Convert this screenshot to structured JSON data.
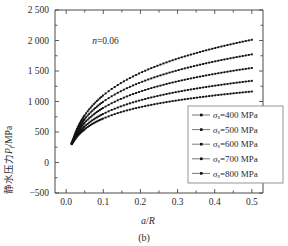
{
  "figure": {
    "caption": "(b)",
    "annotation": "n=0.06"
  },
  "chart_data": {
    "type": "line",
    "title": "",
    "subtitle": "",
    "xlabel": "a/R",
    "ylabel": "静水压力Pf/MPa",
    "xlim": [
      -0.03,
      0.53
    ],
    "ylim": [
      -500,
      2500
    ],
    "xticks": [
      0.0,
      0.1,
      0.2,
      0.3,
      0.4,
      0.5
    ],
    "xtick_labels": [
      "0.0",
      "0.1",
      "0.2",
      "0.3",
      "0.4",
      "0.5"
    ],
    "yticks": [
      -500,
      0,
      500,
      1000,
      1500,
      2000,
      2500
    ],
    "ytick_labels": [
      "−500",
      "0",
      "500",
      "1 000",
      "1 500",
      "2 000",
      "2 500"
    ],
    "grid": false,
    "legend_position": "lower-right",
    "marker": "filled-square",
    "annotations": [
      {
        "text": "n=0.06",
        "x": 0.07,
        "y": 2000
      }
    ],
    "x": [
      0.015,
      0.02,
      0.025,
      0.03,
      0.035,
      0.04,
      0.045,
      0.05,
      0.06,
      0.07,
      0.08,
      0.09,
      0.1,
      0.12,
      0.14,
      0.16,
      0.18,
      0.2,
      0.22,
      0.24,
      0.26,
      0.28,
      0.3,
      0.32,
      0.34,
      0.36,
      0.38,
      0.4,
      0.42,
      0.44,
      0.46,
      0.48,
      0.5
    ],
    "series": [
      {
        "name": "σs=400 MPa",
        "label": "σ",
        "subscript": "s",
        "value": "=400 MPa",
        "values": [
          300,
          345,
          390,
          430,
          465,
          495,
          520,
          545,
          590,
          630,
          665,
          695,
          722,
          770,
          812,
          848,
          880,
          908,
          934,
          958,
          980,
          1000,
          1019,
          1037,
          1054,
          1070,
          1085,
          1100,
          1114,
          1127,
          1140,
          1152,
          1164
        ]
      },
      {
        "name": "σs=500 MPa",
        "label": "σ",
        "subscript": "s",
        "value": "=500 MPa",
        "values": [
          305,
          360,
          412,
          458,
          498,
          533,
          564,
          593,
          644,
          690,
          730,
          766,
          798,
          855,
          904,
          947,
          986,
          1021,
          1053,
          1082,
          1109,
          1135,
          1159,
          1181,
          1202,
          1222,
          1241,
          1259,
          1276,
          1293,
          1309,
          1324,
          1339
        ]
      },
      {
        "name": "σs=600 MPa",
        "label": "σ",
        "subscript": "s",
        "value": "=600 MPa",
        "values": [
          310,
          378,
          440,
          494,
          541,
          583,
          620,
          654,
          715,
          768,
          815,
          858,
          897,
          964,
          1023,
          1075,
          1122,
          1164,
          1203,
          1238,
          1271,
          1302,
          1331,
          1358,
          1384,
          1408,
          1431,
          1453,
          1474,
          1494,
          1514,
          1532,
          1550
        ]
      },
      {
        "name": "σs=700 MPa",
        "label": "σ",
        "subscript": "s",
        "value": "=700 MPa",
        "values": [
          315,
          393,
          465,
          527,
          582,
          630,
          674,
          714,
          785,
          847,
          902,
          952,
          998,
          1077,
          1146,
          1208,
          1263,
          1313,
          1359,
          1401,
          1440,
          1477,
          1511,
          1544,
          1574,
          1603,
          1631,
          1657,
          1682,
          1706,
          1729,
          1751,
          1773
        ]
      },
      {
        "name": "σs=800 MPa",
        "label": "σ",
        "subscript": "s",
        "value": "=800 MPa",
        "values": [
          320,
          408,
          490,
          561,
          623,
          679,
          729,
          775,
          857,
          928,
          992,
          1050,
          1103,
          1195,
          1275,
          1347,
          1411,
          1470,
          1524,
          1573,
          1619,
          1662,
          1703,
          1741,
          1777,
          1811,
          1844,
          1875,
          1905,
          1933,
          1961,
          1987,
          2012
        ]
      }
    ],
    "legend_entries": [
      "σs=400 MPa",
      "σs=500 MPa",
      "σs=600 MPa",
      "σs=700 MPa",
      "σs=800 MPa"
    ]
  }
}
